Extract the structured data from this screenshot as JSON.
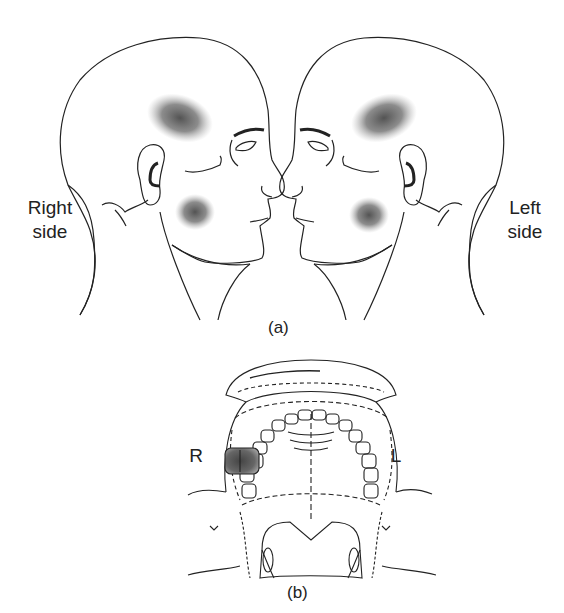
{
  "figure": {
    "panel_a": {
      "caption": "(a)",
      "right_head_label_line1": "Right",
      "right_head_label_line2": "side",
      "left_head_label_line1": "Left",
      "left_head_label_line2": "side",
      "pain_regions": [
        "temporal",
        "masseter/cheek"
      ]
    },
    "panel_b": {
      "caption": "(b)",
      "right_label": "R",
      "left_label": "L",
      "highlighted_tooth_side": "R",
      "highlight_color": "#555555"
    }
  }
}
